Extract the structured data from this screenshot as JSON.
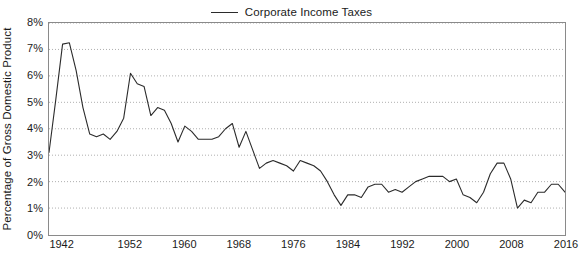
{
  "chart_data": {
    "type": "line",
    "title": "",
    "subtitle": "",
    "xlabel": "",
    "ylabel": "Percentage of Gross Domestic Product",
    "legend": [
      {
        "name": "Corporate Income Taxes",
        "color": "#2b2b2b"
      }
    ],
    "legend_position": "top-center",
    "grid": "horizontal-dotted",
    "line_color": "#2b2b2b",
    "xlim": [
      1940,
      2016
    ],
    "ylim": [
      0,
      8
    ],
    "ytick_labels": [
      "8%",
      "7%",
      "6%",
      "5%",
      "4%",
      "3%",
      "2%",
      "1%",
      "0%"
    ],
    "ytick_values": [
      8,
      7,
      6,
      5,
      4,
      3,
      2,
      1,
      0
    ],
    "xtick_labels": [
      "1942",
      "1952",
      "1960",
      "1968",
      "1976",
      "1984",
      "1992",
      "2000",
      "2008",
      "2016"
    ],
    "xtick_values": [
      1942,
      1952,
      1960,
      1968,
      1976,
      1984,
      1992,
      2000,
      2008,
      2016
    ],
    "series": [
      {
        "name": "Corporate Income Taxes",
        "x": [
          1940,
          1941,
          1942,
          1943,
          1944,
          1945,
          1946,
          1947,
          1948,
          1949,
          1950,
          1951,
          1952,
          1953,
          1954,
          1955,
          1956,
          1957,
          1958,
          1959,
          1960,
          1961,
          1962,
          1963,
          1964,
          1965,
          1966,
          1967,
          1968,
          1969,
          1970,
          1971,
          1972,
          1973,
          1974,
          1975,
          1976,
          1977,
          1978,
          1979,
          1980,
          1981,
          1982,
          1983,
          1984,
          1985,
          1986,
          1987,
          1988,
          1989,
          1990,
          1991,
          1992,
          1993,
          1994,
          1995,
          1996,
          1997,
          1998,
          1999,
          2000,
          2001,
          2002,
          2003,
          2004,
          2005,
          2006,
          2007,
          2008,
          2009,
          2010,
          2011,
          2012,
          2013,
          2014,
          2015,
          2016
        ],
        "values": [
          3.1,
          5.1,
          7.2,
          7.25,
          6.2,
          4.8,
          3.8,
          3.7,
          3.8,
          3.6,
          3.9,
          4.4,
          6.1,
          5.7,
          5.6,
          4.5,
          4.8,
          4.7,
          4.2,
          3.5,
          4.1,
          3.9,
          3.6,
          3.6,
          3.6,
          3.7,
          4.0,
          4.2,
          3.3,
          3.9,
          3.2,
          2.5,
          2.7,
          2.8,
          2.7,
          2.6,
          2.4,
          2.8,
          2.7,
          2.6,
          2.4,
          2.0,
          1.5,
          1.1,
          1.5,
          1.5,
          1.4,
          1.8,
          1.9,
          1.9,
          1.6,
          1.7,
          1.6,
          1.8,
          2.0,
          2.1,
          2.2,
          2.2,
          2.2,
          2.0,
          2.1,
          1.5,
          1.4,
          1.2,
          1.6,
          2.3,
          2.7,
          2.7,
          2.1,
          1.0,
          1.3,
          1.2,
          1.6,
          1.6,
          1.9,
          1.9,
          1.6
        ]
      }
    ]
  },
  "legend": {
    "label": "Corporate Income Taxes"
  },
  "axes": {
    "y_title": "Percentage of Gross Domestic Product"
  }
}
